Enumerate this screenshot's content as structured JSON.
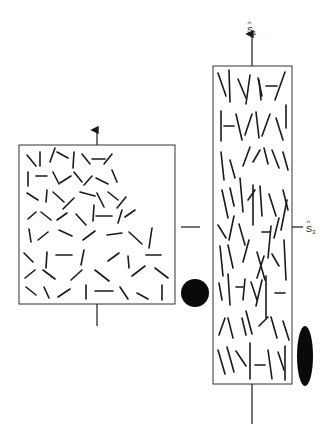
{
  "diagram": {
    "type": "fiber-orientation-schematic",
    "colors": {
      "ink": "#1a1a1a",
      "background": "#ffffff"
    },
    "left_panel": {
      "description": "isotropic random fiber orientation (square sample)",
      "box": {
        "x": 19,
        "y": 145,
        "w": 156,
        "h": 159
      },
      "arrow_up": {
        "x": 97,
        "y1": 145,
        "y2": 130
      },
      "stem_down": {
        "x": 97,
        "y1": 304,
        "y2": 326
      },
      "marker": {
        "shape": "circle",
        "cx": 195,
        "cy": 293,
        "r": 14
      },
      "side_tick": {
        "x1": 181,
        "x2": 200,
        "y": 227
      },
      "fibers": [
        [
          27,
          155,
          36,
          166
        ],
        [
          40,
          152,
          40,
          166
        ],
        [
          50,
          162,
          55,
          148
        ],
        [
          57,
          152,
          68,
          158
        ],
        [
          74,
          152,
          73,
          168
        ],
        [
          82,
          154,
          90,
          164
        ],
        [
          92,
          159,
          105,
          159
        ],
        [
          112,
          154,
          104,
          164
        ],
        [
          28,
          172,
          28,
          186
        ],
        [
          36,
          176,
          47,
          176
        ],
        [
          53,
          172,
          59,
          184
        ],
        [
          60,
          183,
          71,
          176
        ],
        [
          74,
          172,
          82,
          182
        ],
        [
          84,
          185,
          92,
          176
        ],
        [
          96,
          178,
          108,
          184
        ],
        [
          112,
          170,
          117,
          182
        ],
        [
          27,
          193,
          38,
          200
        ],
        [
          47,
          190,
          46,
          202
        ],
        [
          53,
          192,
          64,
          202
        ],
        [
          63,
          209,
          74,
          198
        ],
        [
          80,
          192,
          95,
          196
        ],
        [
          97,
          193,
          104,
          207
        ],
        [
          108,
          192,
          118,
          200
        ],
        [
          117,
          208,
          126,
          197
        ],
        [
          28,
          219,
          36,
          212
        ],
        [
          41,
          212,
          51,
          220
        ],
        [
          57,
          220,
          67,
          213
        ],
        [
          76,
          214,
          86,
          225
        ],
        [
          94,
          205,
          93,
          221
        ],
        [
          96,
          216,
          112,
          216
        ],
        [
          118,
          223,
          122,
          210
        ],
        [
          125,
          217,
          135,
          210
        ],
        [
          29,
          229,
          31,
          242
        ],
        [
          38,
          240,
          48,
          232
        ],
        [
          59,
          230,
          72,
          236
        ],
        [
          83,
          240,
          95,
          231
        ],
        [
          107,
          235,
          122,
          233
        ],
        [
          129,
          232,
          142,
          244
        ],
        [
          152,
          228,
          149,
          248
        ],
        [
          24,
          253,
          33,
          262
        ],
        [
          47,
          252,
          46,
          268
        ],
        [
          56,
          255,
          72,
          255
        ],
        [
          84,
          250,
          81,
          265
        ],
        [
          108,
          261,
          119,
          253
        ],
        [
          128,
          256,
          129,
          268
        ],
        [
          146,
          255,
          161,
          255
        ],
        [
          25,
          278,
          35,
          270
        ],
        [
          43,
          270,
          55,
          279
        ],
        [
          71,
          280,
          82,
          270
        ],
        [
          95,
          270,
          109,
          281
        ],
        [
          132,
          276,
          145,
          266
        ],
        [
          155,
          268,
          168,
          278
        ],
        [
          26,
          287,
          36,
          295
        ],
        [
          44,
          287,
          49,
          298
        ],
        [
          58,
          297,
          70,
          289
        ],
        [
          86,
          285,
          86,
          299
        ],
        [
          95,
          291,
          113,
          291
        ],
        [
          120,
          287,
          128,
          299
        ],
        [
          137,
          293,
          148,
          299
        ],
        [
          162,
          285,
          162,
          300
        ]
      ]
    },
    "right_panel": {
      "description": "aligned fiber orientation (elongated sample)",
      "box": {
        "x": 213,
        "y": 66,
        "w": 79,
        "h": 318
      },
      "axis_s1": {
        "x": 252,
        "y1": 66,
        "y2": 34,
        "label": "S",
        "subscript": "1",
        "hat": "^"
      },
      "axis_s3": {
        "x1": 292,
        "x2": 303,
        "y": 227,
        "label": "S",
        "subscript": "3",
        "hat": "^"
      },
      "stem_down": {
        "x": 252,
        "y1": 384,
        "y2": 424
      },
      "marker": {
        "shape": "ellipse",
        "cx": 305,
        "cy": 356,
        "rx": 8,
        "ry": 30
      },
      "fibers": [
        [
          218,
          73,
          226,
          96
        ],
        [
          229,
          70,
          230,
          102
        ],
        [
          238,
          79,
          246,
          98
        ],
        [
          250,
          75,
          246,
          104
        ],
        [
          259,
          80,
          261,
          100
        ],
        [
          258,
          78,
          262,
          96
        ],
        [
          266,
          86,
          277,
          86
        ],
        [
          285,
          72,
          275,
          100
        ],
        [
          221,
          111,
          221,
          141
        ],
        [
          224,
          126,
          234,
          126
        ],
        [
          236,
          114,
          242,
          140
        ],
        [
          245,
          135,
          252,
          114
        ],
        [
          256,
          112,
          259,
          138
        ],
        [
          262,
          136,
          270,
          114
        ],
        [
          276,
          118,
          283,
          140
        ],
        [
          286,
          105,
          286,
          128
        ],
        [
          221,
          152,
          224,
          180
        ],
        [
          230,
          160,
          235,
          178
        ],
        [
          243,
          166,
          250,
          147
        ],
        [
          253,
          162,
          260,
          150
        ],
        [
          264,
          148,
          268,
          164
        ],
        [
          272,
          150,
          279,
          168
        ],
        [
          283,
          152,
          288,
          170
        ],
        [
          222,
          190,
          228,
          218
        ],
        [
          230,
          188,
          234,
          206
        ],
        [
          240,
          178,
          243,
          212
        ],
        [
          248,
          200,
          255,
          190
        ],
        [
          260,
          186,
          262,
          216
        ],
        [
          269,
          194,
          276,
          216
        ],
        [
          283,
          190,
          288,
          210
        ],
        [
          218,
          225,
          226,
          238
        ],
        [
          234,
          216,
          229,
          240
        ],
        [
          239,
          224,
          245,
          245
        ],
        [
          253,
          185,
          253,
          225
        ],
        [
          262,
          232,
          270,
          232
        ],
        [
          271,
          226,
          268,
          258
        ],
        [
          279,
          218,
          274,
          238
        ],
        [
          287,
          200,
          281,
          230
        ],
        [
          220,
          246,
          223,
          276
        ],
        [
          228,
          245,
          233,
          268
        ],
        [
          243,
          262,
          249,
          240
        ],
        [
          257,
          252,
          265,
          280
        ],
        [
          264,
          256,
          257,
          278
        ],
        [
          272,
          254,
          279,
          266
        ],
        [
          284,
          240,
          286,
          280
        ],
        [
          219,
          283,
          222,
          300
        ],
        [
          228,
          274,
          230,
          305
        ],
        [
          236,
          287,
          243,
          287
        ],
        [
          245,
          279,
          243,
          300
        ],
        [
          251,
          282,
          257,
          300
        ],
        [
          262,
          280,
          256,
          306
        ],
        [
          266,
          276,
          266,
          318
        ],
        [
          275,
          293,
          285,
          293
        ],
        [
          219,
          335,
          225,
          318
        ],
        [
          228,
          318,
          233,
          338
        ],
        [
          242,
          318,
          246,
          335
        ],
        [
          246,
          311,
          252,
          334
        ],
        [
          259,
          326,
          268,
          317
        ],
        [
          271,
          317,
          277,
          338
        ],
        [
          283,
          321,
          289,
          340
        ],
        [
          218,
          350,
          225,
          374
        ],
        [
          227,
          347,
          234,
          372
        ],
        [
          236,
          351,
          246,
          366
        ],
        [
          250,
          343,
          250,
          379
        ],
        [
          255,
          365,
          265,
          365
        ],
        [
          268,
          350,
          272,
          379
        ],
        [
          278,
          352,
          284,
          370
        ],
        [
          285,
          346,
          285,
          380
        ]
      ]
    }
  }
}
